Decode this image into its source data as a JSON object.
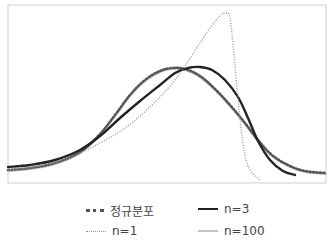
{
  "chart_data": {
    "type": "line",
    "title": "",
    "xlabel": "",
    "ylabel": "",
    "grid": false,
    "legend_position": "bottom",
    "axes_visible": false,
    "series": [
      {
        "name": "정규분포",
        "style": "dotted",
        "color": "#555555",
        "points": [
          [
            8,
            170
          ],
          [
            30,
            168
          ],
          [
            55,
            163
          ],
          [
            80,
            152
          ],
          [
            100,
            134
          ],
          [
            115,
            115
          ],
          [
            130,
            95
          ],
          [
            145,
            80
          ],
          [
            160,
            71
          ],
          [
            172,
            68
          ],
          [
            185,
            69
          ],
          [
            200,
            76
          ],
          [
            215,
            89
          ],
          [
            230,
            105
          ],
          [
            245,
            123
          ],
          [
            258,
            140
          ],
          [
            272,
            155
          ],
          [
            288,
            165
          ],
          [
            305,
            171
          ],
          [
            326,
            173
          ]
        ]
      },
      {
        "name": "n=3",
        "style": "solid",
        "color": "#222222",
        "points": [
          [
            8,
            167
          ],
          [
            30,
            165
          ],
          [
            55,
            160
          ],
          [
            80,
            150
          ],
          [
            100,
            136
          ],
          [
            120,
            118
          ],
          [
            140,
            101
          ],
          [
            160,
            85
          ],
          [
            175,
            73
          ],
          [
            188,
            68
          ],
          [
            200,
            67
          ],
          [
            212,
            70
          ],
          [
            225,
            80
          ],
          [
            238,
            97
          ],
          [
            248,
            118
          ],
          [
            258,
            141
          ],
          [
            270,
            160
          ],
          [
            283,
            171
          ],
          [
            295,
            175
          ]
        ]
      },
      {
        "name": "n=1",
        "style": "dotted",
        "color": "#999999",
        "points": [
          [
            8,
            170
          ],
          [
            40,
            166
          ],
          [
            70,
            158
          ],
          [
            100,
            143
          ],
          [
            125,
            128
          ],
          [
            150,
            107
          ],
          [
            170,
            86
          ],
          [
            185,
            66
          ],
          [
            198,
            46
          ],
          [
            210,
            28
          ],
          [
            220,
            16
          ],
          [
            226,
            13
          ],
          [
            230,
            18
          ],
          [
            234,
            55
          ],
          [
            239,
            110
          ],
          [
            244,
            150
          ],
          [
            250,
            170
          ],
          [
            260,
            180
          ]
        ]
      },
      {
        "name": "n=100",
        "style": "solid",
        "color": "#c4c4c4",
        "points": [
          [
            8,
            171
          ],
          [
            30,
            169
          ],
          [
            55,
            164
          ],
          [
            80,
            153
          ],
          [
            100,
            135
          ],
          [
            115,
            116
          ],
          [
            130,
            96
          ],
          [
            145,
            81
          ],
          [
            160,
            72
          ],
          [
            172,
            69
          ],
          [
            185,
            70
          ],
          [
            200,
            77
          ],
          [
            215,
            90
          ],
          [
            230,
            106
          ],
          [
            245,
            124
          ],
          [
            258,
            141
          ],
          [
            272,
            156
          ],
          [
            288,
            166
          ],
          [
            305,
            172
          ],
          [
            326,
            174
          ]
        ]
      }
    ],
    "frame": {
      "x0": 8,
      "y0": 5,
      "x1": 326,
      "y1": 183,
      "color": "#d8d8d8"
    }
  },
  "legend": {
    "items": [
      {
        "label": "정규분포",
        "key": "normal"
      },
      {
        "label": "n=3",
        "key": "n3"
      },
      {
        "label": "n=1",
        "key": "n1"
      },
      {
        "label": "n=100",
        "key": "n100"
      }
    ]
  }
}
